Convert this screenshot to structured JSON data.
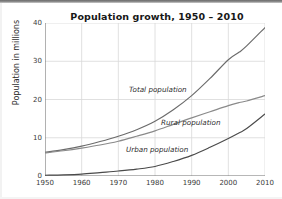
{
  "chart_data": {
    "type": "line",
    "title": "Population growth, 1950 – 2010",
    "xlabel": "",
    "ylabel": "Population in millions",
    "xlim": [
      1950,
      2010
    ],
    "ylim": [
      0,
      40
    ],
    "x_ticks": [
      "1950",
      "1960",
      "1970",
      "1980",
      "1990",
      "2000",
      "2010"
    ],
    "y_ticks": [
      "0",
      "10",
      "20",
      "30",
      "40"
    ],
    "grid": true,
    "legend_position": "inline-annotations",
    "x": [
      1950,
      1955,
      1960,
      1965,
      1970,
      1975,
      1980,
      1985,
      1990,
      1995,
      2000,
      2003,
      2005,
      2010
    ],
    "series": [
      {
        "name": "Total population",
        "label": "Total population",
        "color": "#6b6b6b",
        "values": [
          6.2,
          6.9,
          7.8,
          9.0,
          10.4,
          12.1,
          14.3,
          17.3,
          21.0,
          25.5,
          30.4,
          32.4,
          34.0,
          38.8
        ]
      },
      {
        "name": "Rural population",
        "label": "Rural population",
        "color": "#8a8a8a",
        "values": [
          6.0,
          6.6,
          7.3,
          8.1,
          9.1,
          10.4,
          11.8,
          13.5,
          15.2,
          16.8,
          18.4,
          19.2,
          19.6,
          21.0
        ]
      },
      {
        "name": "Urban population",
        "label": "Urban population",
        "color": "#4a4a4a",
        "values": [
          0.2,
          0.3,
          0.5,
          0.9,
          1.3,
          1.8,
          2.5,
          3.8,
          5.4,
          7.5,
          9.8,
          11.3,
          12.4,
          16.2
        ]
      }
    ],
    "colors": {
      "grid": "#d8d8d8",
      "axis": "#707070",
      "text": "#222222",
      "background": "#ffffff"
    }
  }
}
